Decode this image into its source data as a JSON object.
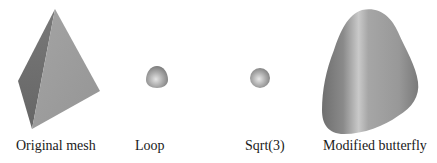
{
  "panels": [
    {
      "id": "original",
      "label": "Original mesh",
      "shape": "tetrahedron"
    },
    {
      "id": "loop",
      "label": "Loop",
      "shape": "small-rounded-blob"
    },
    {
      "id": "sqrt3",
      "label": "Sqrt(3)",
      "shape": "small-sphere"
    },
    {
      "id": "butterfly",
      "label": "Modified butterfly",
      "shape": "large-rounded-tetrahedron"
    }
  ],
  "colors": {
    "background": "#ffffff",
    "mesh_light": "#a8a8a8",
    "mesh_mid": "#8e8e8e",
    "mesh_dark": "#6e6e6e",
    "text": "#1a1a1a"
  }
}
